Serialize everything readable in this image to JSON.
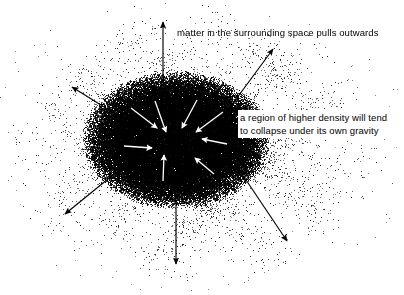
{
  "figure": {
    "width": 404,
    "height": 295,
    "background_color": "#ffffff",
    "ink_color": "#000000"
  },
  "annotations": {
    "outward_label": "matter in the surrounding space pulls outwards",
    "collapse_label": "a region of higher density will tend to collapse under its own gravity"
  },
  "diagram_data": {
    "type": "conceptual-physics-diagram",
    "core": {
      "name": "high-density-region",
      "shape": "ellipse",
      "center_x": 176,
      "center_y": 140,
      "radius_x": 78,
      "radius_y": 57,
      "density": "high",
      "fill": "#000000"
    },
    "field": {
      "name": "surrounding-matter-field",
      "shape": "stippled-cloud",
      "center_x": 196,
      "center_y": 145,
      "radius_x": 198,
      "radius_y": 148,
      "density": "low-to-medium"
    },
    "inward_arrows": {
      "color": "#ffffff",
      "count": 8,
      "meaning": "self-gravity pulling matter inward",
      "vectors": [
        {
          "x1": 155,
          "y1": 101,
          "x2": 166,
          "y2": 132
        },
        {
          "x1": 197,
          "y1": 100,
          "x2": 182,
          "y2": 128
        },
        {
          "x1": 131,
          "y1": 108,
          "x2": 157,
          "y2": 128
        },
        {
          "x1": 223,
          "y1": 112,
          "x2": 196,
          "y2": 132
        },
        {
          "x1": 124,
          "y1": 146,
          "x2": 152,
          "y2": 148
        },
        {
          "x1": 227,
          "y1": 144,
          "x2": 202,
          "y2": 139
        },
        {
          "x1": 163,
          "y1": 181,
          "x2": 164,
          "y2": 155
        },
        {
          "x1": 214,
          "y1": 174,
          "x2": 195,
          "y2": 158
        }
      ]
    },
    "outward_arrows": {
      "color": "#000000",
      "count": 6,
      "meaning": "matter in the surrounding space pulls outwards",
      "vectors": [
        {
          "x1": 163,
          "y1": 112,
          "x2": 163,
          "y2": 22
        },
        {
          "x1": 231,
          "y1": 106,
          "x2": 273,
          "y2": 49
        },
        {
          "x1": 125,
          "y1": 120,
          "x2": 72,
          "y2": 87
        },
        {
          "x1": 124,
          "y1": 166,
          "x2": 65,
          "y2": 214
        },
        {
          "x1": 176,
          "y1": 190,
          "x2": 176,
          "y2": 264
        },
        {
          "x1": 238,
          "y1": 168,
          "x2": 287,
          "y2": 241
        }
      ]
    }
  }
}
